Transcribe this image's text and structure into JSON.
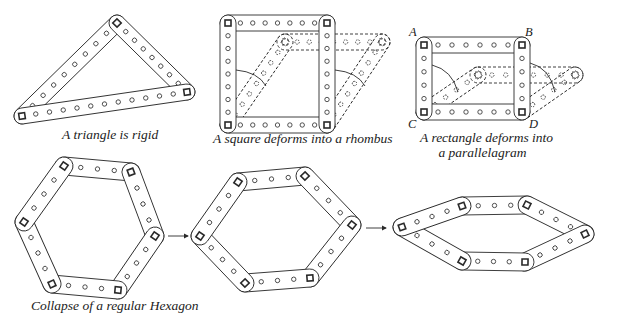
{
  "captions": {
    "triangle": "A triangle is rigid",
    "square": "A square deforms into a rhombus",
    "rectangle_line1": "A rectangle deforms into",
    "rectangle_line2": "a parallelagram",
    "hexagon": "Collapse of a regular Hexagon"
  },
  "vertex_labels": {
    "A": "A",
    "B": "B",
    "C": "C",
    "D": "D"
  },
  "colors": {
    "ink": "#2a2a2a",
    "paper": "#ffffff"
  },
  "figures": {
    "triangle": {
      "bars": [
        {
          "p1": [
            22,
            116
          ],
          "p2": [
            117,
            23
          ],
          "holes": 8
        },
        {
          "p1": [
            117,
            23
          ],
          "p2": [
            187,
            92
          ],
          "holes": 7
        },
        {
          "p1": [
            22,
            116
          ],
          "p2": [
            187,
            92
          ],
          "holes": 11
        }
      ]
    },
    "square": {
      "solid_bars": [
        {
          "p1": [
            228,
            23
          ],
          "p2": [
            327,
            23
          ],
          "holes": 7
        },
        {
          "p1": [
            228,
            125
          ],
          "p2": [
            327,
            125
          ],
          "holes": 7
        },
        {
          "p1": [
            228,
            23
          ],
          "p2": [
            228,
            125
          ],
          "holes": 7
        },
        {
          "p1": [
            327,
            23
          ],
          "p2": [
            327,
            125
          ],
          "holes": 7
        }
      ],
      "dashed_bars": [
        {
          "p1": [
            285,
            42
          ],
          "p2": [
            382,
            42
          ],
          "holes": 7
        },
        {
          "p1": [
            228,
            125
          ],
          "p2": [
            285,
            42
          ],
          "holes": 7
        },
        {
          "p1": [
            327,
            125
          ],
          "p2": [
            382,
            42
          ],
          "holes": 7
        }
      ]
    },
    "rectangle": {
      "solid_bars": [
        {
          "p1": [
            424,
            45
          ],
          "p2": [
            522,
            45
          ],
          "holes": 6
        },
        {
          "p1": [
            424,
            112
          ],
          "p2": [
            522,
            112
          ],
          "holes": 6
        },
        {
          "p1": [
            424,
            45
          ],
          "p2": [
            424,
            112
          ],
          "holes": 4
        },
        {
          "p1": [
            522,
            45
          ],
          "p2": [
            522,
            112
          ],
          "holes": 4
        }
      ],
      "dashed_bars": [
        {
          "p1": [
            478,
            75
          ],
          "p2": [
            575,
            75
          ],
          "holes": 6
        },
        {
          "p1": [
            424,
            112
          ],
          "p2": [
            478,
            75
          ],
          "holes": 4
        },
        {
          "p1": [
            522,
            112
          ],
          "p2": [
            575,
            75
          ],
          "holes": 4
        }
      ]
    },
    "hexagon_regular": {
      "vertices": [
        [
          64,
          166
        ],
        [
          131,
          172
        ],
        [
          155,
          236
        ],
        [
          118,
          290
        ],
        [
          52,
          284
        ],
        [
          24,
          222
        ]
      ]
    },
    "hexagon_skewed": {
      "vertices": [
        [
          238,
          182
        ],
        [
          305,
          176
        ],
        [
          352,
          225
        ],
        [
          310,
          278
        ],
        [
          245,
          283
        ],
        [
          200,
          236
        ]
      ]
    },
    "hexagon_collapsed": {
      "vertices": [
        [
          462,
          206
        ],
        [
          527,
          205
        ],
        [
          585,
          234
        ],
        [
          525,
          262
        ],
        [
          462,
          261
        ],
        [
          402,
          227
        ]
      ]
    },
    "arrows": [
      {
        "from": [
          168,
          236
        ],
        "to": [
          188,
          236
        ]
      },
      {
        "from": [
          366,
          228
        ],
        "to": [
          386,
          228
        ]
      }
    ]
  }
}
